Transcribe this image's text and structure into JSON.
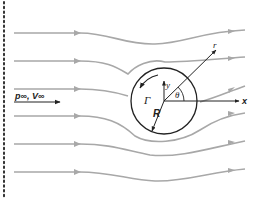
{
  "figure": {
    "labels": {
      "freestream": "p∞, V∞",
      "circulation": "Γ",
      "radius": "R",
      "theta": "θ",
      "r_axis": "r",
      "x_axis": "x",
      "y_axis": "y"
    },
    "colors": {
      "streamline": "#a8a8a8",
      "axis": "#222222",
      "border_dots": "#333333"
    }
  }
}
